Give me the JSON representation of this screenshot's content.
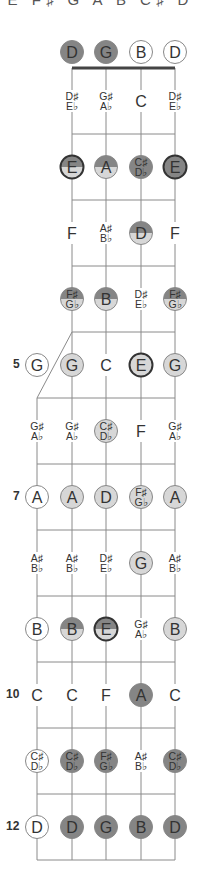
{
  "header": {
    "scale_notes": "E F♯ G A B C♯ D"
  },
  "colors": {
    "dark": "#858585",
    "light": "#d7d7d7",
    "white": "#ffffff",
    "stroke": "#888888",
    "root_stroke": "#333333",
    "text": "#333333",
    "line": "#8a8a8a",
    "nut": "#444444"
  },
  "open_strings": [
    {
      "note": "D",
      "style": "dark"
    },
    {
      "note": "G",
      "style": "dark"
    },
    {
      "note": "B",
      "style": "white"
    },
    {
      "note": "D",
      "style": "white"
    }
  ],
  "frets": [
    {
      "fret": 1,
      "label": "",
      "notes": [
        null,
        {
          "note": "D♯/E♭",
          "style": "none"
        },
        {
          "note": "G♯/A♭",
          "style": "none"
        },
        {
          "note": "C",
          "style": "none"
        },
        {
          "note": "D♯/E♭",
          "style": "none"
        }
      ]
    },
    {
      "fret": 2,
      "label": "",
      "notes": [
        null,
        {
          "note": "E",
          "style": "split",
          "root": true
        },
        {
          "note": "A",
          "style": "split"
        },
        {
          "note": "C♯/D♭",
          "style": "dark"
        },
        {
          "note": "E",
          "style": "dark",
          "root": true
        }
      ]
    },
    {
      "fret": 3,
      "label": "",
      "notes": [
        null,
        {
          "note": "F",
          "style": "none"
        },
        {
          "note": "A♯/B♭",
          "style": "none"
        },
        {
          "note": "D",
          "style": "split"
        },
        {
          "note": "F",
          "style": "none"
        }
      ]
    },
    {
      "fret": 4,
      "label": "",
      "notes": [
        null,
        {
          "note": "F♯/G♭",
          "style": "split"
        },
        {
          "note": "B",
          "style": "split"
        },
        {
          "note": "D♯/E♭",
          "style": "none"
        },
        {
          "note": "F♯/G♭",
          "style": "split"
        }
      ]
    },
    {
      "fret": 5,
      "label": "5",
      "notes": [
        {
          "note": "G",
          "style": "white"
        },
        {
          "note": "G",
          "style": "light"
        },
        {
          "note": "C",
          "style": "none"
        },
        {
          "note": "E",
          "style": "light",
          "root": true
        },
        {
          "note": "G",
          "style": "light"
        }
      ]
    },
    {
      "fret": 6,
      "label": "",
      "notes": [
        {
          "note": "G♯/A♭",
          "style": "none"
        },
        {
          "note": "G♯/A♭",
          "style": "none"
        },
        {
          "note": "C♯/D♭",
          "style": "light"
        },
        {
          "note": "F",
          "style": "none"
        },
        {
          "note": "G♯/A♭",
          "style": "none"
        }
      ]
    },
    {
      "fret": 7,
      "label": "7",
      "notes": [
        {
          "note": "A",
          "style": "white"
        },
        {
          "note": "A",
          "style": "light"
        },
        {
          "note": "D",
          "style": "light"
        },
        {
          "note": "F♯/G♭",
          "style": "light"
        },
        {
          "note": "A",
          "style": "light"
        }
      ]
    },
    {
      "fret": 8,
      "label": "",
      "notes": [
        {
          "note": "A♯/B♭",
          "style": "none"
        },
        {
          "note": "A♯/B♭",
          "style": "none"
        },
        {
          "note": "D♯/E♭",
          "style": "none"
        },
        {
          "note": "G",
          "style": "light"
        },
        {
          "note": "A♯/B♭",
          "style": "none"
        }
      ]
    },
    {
      "fret": 9,
      "label": "",
      "notes": [
        {
          "note": "B",
          "style": "white"
        },
        {
          "note": "B",
          "style": "split"
        },
        {
          "note": "E",
          "style": "split",
          "root": true
        },
        {
          "note": "G♯/A♭",
          "style": "none"
        },
        {
          "note": "B",
          "style": "light"
        }
      ]
    },
    {
      "fret": 10,
      "label": "10",
      "notes": [
        {
          "note": "C",
          "style": "none"
        },
        {
          "note": "C",
          "style": "none"
        },
        {
          "note": "F",
          "style": "none"
        },
        {
          "note": "A",
          "style": "dark"
        },
        {
          "note": "C",
          "style": "none"
        }
      ]
    },
    {
      "fret": 11,
      "label": "",
      "notes": [
        {
          "note": "C♯/D♭",
          "style": "white"
        },
        {
          "note": "C♯/D♭",
          "style": "dark"
        },
        {
          "note": "F♯/G♭",
          "style": "dark"
        },
        {
          "note": "A♯/B♭",
          "style": "none"
        },
        {
          "note": "C♯/D♭",
          "style": "dark"
        }
      ]
    },
    {
      "fret": 12,
      "label": "12",
      "notes": [
        {
          "note": "D",
          "style": "white"
        },
        {
          "note": "D",
          "style": "dark"
        },
        {
          "note": "G",
          "style": "dark"
        },
        {
          "note": "B",
          "style": "dark"
        },
        {
          "note": "D",
          "style": "dark"
        }
      ]
    }
  ]
}
